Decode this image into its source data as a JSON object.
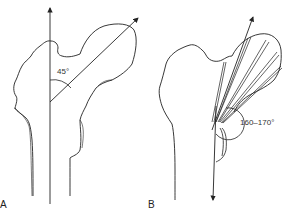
{
  "figure": {
    "panels": [
      {
        "id": "A",
        "label": "A",
        "angle_label": "45°",
        "description": "Proximal femur with vertical shaft axis and femoral neck axis at 45°"
      },
      {
        "id": "B",
        "label": "B",
        "angle_label": "160–170°",
        "description": "Proximal femur with fan of trabecular lines and downward axis, angle 160–170°"
      }
    ],
    "colors": {
      "line": "#222222",
      "background": "#ffffff"
    }
  }
}
